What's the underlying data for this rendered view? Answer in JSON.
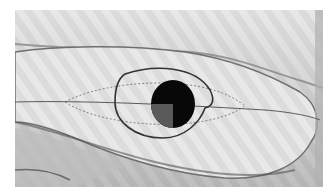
{
  "image": {
    "description": "Grayscale photograph of a draped fabric-like elongated form with a hand-drawn oval outline, a dashed lens-shaped marking along a horizontal line, and a solid dark circle with a lighter lower-left quadrant at center",
    "colors": {
      "background": "#ffffff",
      "fabric_light": "#e4e4e4",
      "fabric_mid": "#cfcfcf",
      "fabric_shadow": "#8a8a8a",
      "outline": "#3a3a3a",
      "circle": "#080808",
      "quadrant": "#5a5a5a"
    }
  }
}
